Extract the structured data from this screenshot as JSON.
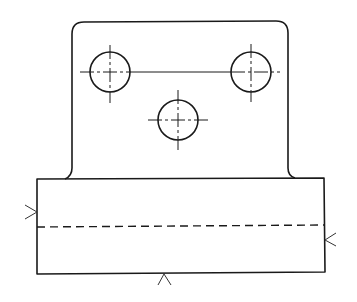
{
  "drawing": {
    "type": "orthographic-view",
    "background": "#ffffff",
    "line_color": "#1a1a1a",
    "upright": {
      "x_left": 72,
      "x_right": 288,
      "y_top": 22,
      "y_bottom": 179,
      "corner_radius": 12,
      "fillet_radius": 7
    },
    "base": {
      "x_left": 37,
      "x_right": 324,
      "y_top": 179,
      "y_bottom": 274
    },
    "holes": [
      {
        "name": "hole-top-left",
        "cx": 110,
        "cy": 72,
        "r": 20
      },
      {
        "name": "hole-top-right",
        "cx": 251,
        "cy": 72,
        "r": 20
      },
      {
        "name": "hole-center",
        "cx": 178,
        "cy": 120,
        "r": 20
      }
    ],
    "hole_connector_line": {
      "x1": 130,
      "y1": 72,
      "x2": 231,
      "y2": 72
    },
    "hidden_line": {
      "x1": 37,
      "y1": 227,
      "x2": 324,
      "y2": 225
    },
    "view_arrows": [
      {
        "name": "view-arrow-left",
        "direction": "right",
        "tip_x": 37,
        "tip_y": 212
      },
      {
        "name": "view-arrow-right",
        "direction": "left",
        "tip_x": 325,
        "tip_y": 240
      },
      {
        "name": "view-arrow-bottom",
        "direction": "up",
        "tip_x": 164,
        "tip_y": 274
      }
    ]
  }
}
